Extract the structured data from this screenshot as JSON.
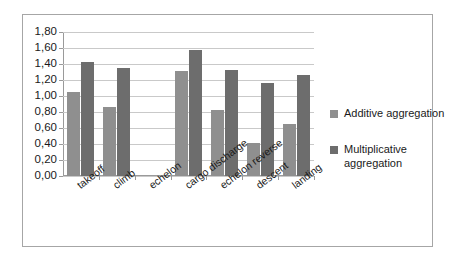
{
  "chart_data": {
    "type": "bar",
    "title": "",
    "xlabel": "",
    "ylabel": "",
    "ylim": [
      0,
      1.8
    ],
    "ytick_labels": [
      "1,80",
      "1,60",
      "1,40",
      "1,20",
      "1,00",
      "0,80",
      "0,60",
      "0,40",
      "0,20",
      "0,00"
    ],
    "ytick_values": [
      1.8,
      1.6,
      1.4,
      1.2,
      1.0,
      0.8,
      0.6,
      0.4,
      0.2,
      0.0
    ],
    "grid": true,
    "legend_position": "right",
    "decimal_separator": ",",
    "categories": [
      "takeoff",
      "climb",
      "echelon",
      "cargo discharge",
      "echelon reverse",
      "descent",
      "landing"
    ],
    "series": [
      {
        "name": "Additive aggregation",
        "color": "#8f8f8f",
        "values": [
          1.05,
          0.86,
          0.0,
          1.31,
          0.82,
          0.41,
          0.65
        ]
      },
      {
        "name": "Multiplicative aggregation",
        "color": "#6d6d6d",
        "values": [
          1.43,
          1.35,
          0.0,
          1.57,
          1.33,
          1.16,
          1.26
        ]
      }
    ]
  },
  "legend": {
    "items": [
      {
        "label": "Additive aggregation"
      },
      {
        "label": "Multiplicative aggregation"
      }
    ]
  }
}
